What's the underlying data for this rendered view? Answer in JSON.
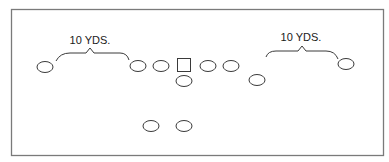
{
  "diagram": {
    "type": "football-formation",
    "frame": {
      "x": 11,
      "y": 9,
      "width": 372,
      "height": 146,
      "stroke": "#7a7a7a"
    },
    "labels": {
      "left_distance": "10 YDS.",
      "right_distance": "10 YDS."
    },
    "players": [
      {
        "id": "left-wide-receiver",
        "shape": "oval",
        "cx": 45,
        "cy": 67
      },
      {
        "id": "left-tackle",
        "shape": "oval",
        "cx": 138,
        "cy": 66
      },
      {
        "id": "left-guard",
        "shape": "oval",
        "cx": 161,
        "cy": 66
      },
      {
        "id": "center",
        "shape": "square",
        "cx": 184,
        "cy": 65
      },
      {
        "id": "right-guard",
        "shape": "oval",
        "cx": 208,
        "cy": 66
      },
      {
        "id": "right-tackle",
        "shape": "oval",
        "cx": 231,
        "cy": 66
      },
      {
        "id": "quarterback",
        "shape": "oval",
        "cx": 184,
        "cy": 81
      },
      {
        "id": "slot-back",
        "shape": "oval",
        "cx": 257,
        "cy": 80
      },
      {
        "id": "right-wide-receiver",
        "shape": "oval",
        "cx": 346,
        "cy": 64
      },
      {
        "id": "left-back",
        "shape": "oval",
        "cx": 151,
        "cy": 126
      },
      {
        "id": "right-back",
        "shape": "oval",
        "cx": 184,
        "cy": 126
      }
    ],
    "stroke_color": "#3a3a3a"
  }
}
